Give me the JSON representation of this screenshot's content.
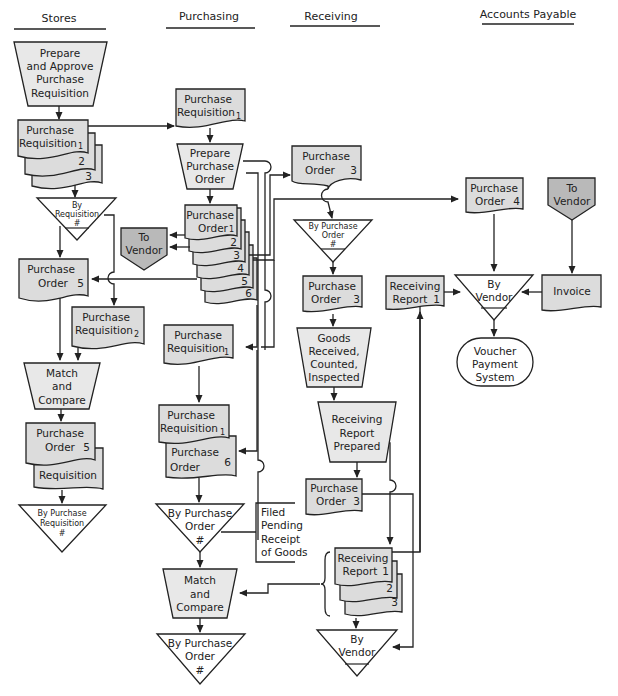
{
  "lanes": [
    {
      "id": "stores",
      "label": "Stores"
    },
    {
      "id": "purchasing",
      "label": "Purchasing"
    },
    {
      "id": "receiving",
      "label": "Receiving"
    },
    {
      "id": "ap",
      "label": "Accounts Payable"
    }
  ],
  "nodes": {
    "s_prepare": [
      "Prepare",
      "and Approve",
      "Purchase",
      "Requisition"
    ],
    "s_pr": [
      "Purchase",
      "Requisition"
    ],
    "s_pr_copies": [
      "1",
      "2",
      "3"
    ],
    "s_file1": [
      "By",
      "Requisition",
      "#"
    ],
    "s_po5": [
      "Purchase",
      "Order",
      "5"
    ],
    "s_pr2": [
      "Purchase",
      "Requisition",
      "2"
    ],
    "s_match": [
      "Match",
      "and",
      "Compare"
    ],
    "s_po5b": [
      "Purchase",
      "Order",
      "5"
    ],
    "s_req": [
      "Requisition"
    ],
    "s_file2": [
      "By Purchase",
      "Requisition",
      "#"
    ],
    "p_pr1": [
      "Purchase",
      "Requisition",
      "1"
    ],
    "p_prepare": [
      "Prepare",
      "Purchase",
      "Order"
    ],
    "p_po": [
      "Purchase",
      "Order"
    ],
    "p_po_copies": [
      "1",
      "2",
      "3",
      "4",
      "5",
      "6"
    ],
    "p_vendor": [
      "To",
      "Vendor"
    ],
    "p_pr1b": [
      "Purchase",
      "Requisition",
      "1"
    ],
    "p_pr1c": [
      "Purchase",
      "Requisition",
      "1"
    ],
    "p_po6": [
      "Purchase",
      "Order",
      "6"
    ],
    "p_file1": [
      "By Purchase",
      "Order",
      "#"
    ],
    "p_note": [
      "Filed",
      "Pending",
      "Receipt",
      "of Goods"
    ],
    "p_match": [
      "Match",
      "and",
      "Compare"
    ],
    "p_file2": [
      "By Purchase",
      "Order",
      "#"
    ],
    "r_po3a": [
      "Purchase",
      "Order",
      "3"
    ],
    "r_file1": [
      "By Purchase",
      "Order",
      "#"
    ],
    "r_po3b": [
      "Purchase",
      "Order",
      "3"
    ],
    "r_goods": [
      "Goods",
      "Received,",
      "Counted,",
      "Inspected"
    ],
    "r_rrprep": [
      "Receiving",
      "Report",
      "Prepared"
    ],
    "r_po3c": [
      "Purchase",
      "Order",
      "3"
    ],
    "r_rr": [
      "Receiving",
      "Report"
    ],
    "r_rr_copies": [
      "1",
      "2",
      "3"
    ],
    "r_file2": [
      "By",
      "Vendor"
    ],
    "a_po4": [
      "Purchase",
      "Order",
      "4"
    ],
    "a_vendor": [
      "To",
      "Vendor"
    ],
    "a_rr1": [
      "Receiving",
      "Report",
      "1"
    ],
    "a_file": [
      "By",
      "Vendor"
    ],
    "a_invoice": [
      "Invoice"
    ],
    "a_voucher": [
      "Voucher",
      "Payment",
      "System"
    ]
  }
}
